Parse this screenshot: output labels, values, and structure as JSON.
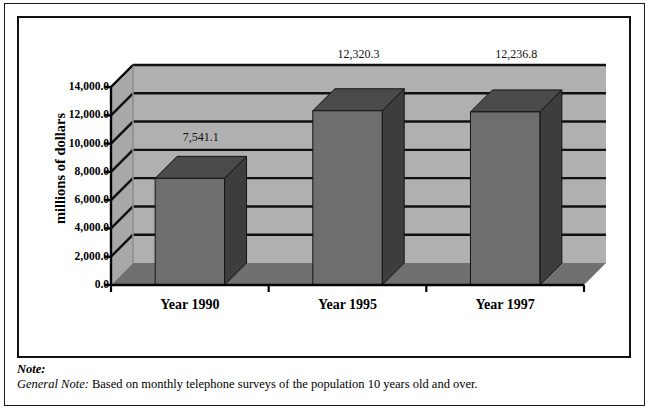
{
  "chart_data": {
    "type": "bar",
    "title": "",
    "xlabel": "",
    "ylabel": "millions of dollars",
    "categories": [
      "Year 1990",
      "Year 1995",
      "Year 1997"
    ],
    "values": [
      7541.1,
      12320.3,
      12236.8
    ],
    "value_labels": [
      "7,541.1",
      "12,320.3",
      "12,236.8"
    ],
    "ylim": [
      0.0,
      14000.0
    ],
    "ytick_values": [
      0.0,
      2000.0,
      4000.0,
      6000.0,
      8000.0,
      10000.0,
      12000.0,
      14000.0
    ],
    "ytick_labels": [
      "0.0",
      "2,000.0",
      "4,000.0",
      "6,000.0",
      "8,000.0",
      "10,000.0",
      "12,000.0",
      "14,000.0"
    ],
    "grid": true,
    "legend": "none",
    "style": "3d-column",
    "colors": {
      "bar_front": "#6e6e6e",
      "bar_side": "#3d3d3d",
      "bar_top": "#4a4a4a",
      "wall_back": "#b0b0b0",
      "wall_left": "#a8a8a8",
      "floor": "#707070",
      "gridline": "#111111",
      "axis": "#000000"
    }
  },
  "notes": {
    "note_label": "Note:",
    "general_label": "General Note:",
    "general_text": "Based on monthly telephone surveys of the population 10 years old and over."
  }
}
